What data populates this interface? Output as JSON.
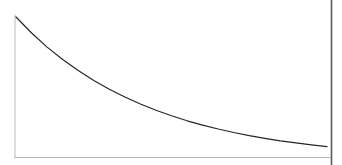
{
  "figure": {
    "title": "",
    "background_color": "#ffffff",
    "width": 342,
    "height": 165,
    "caption": ""
  },
  "axes": {
    "axis_color": "#b9b9b9",
    "axis_width": 1,
    "y_axis": {
      "x": 15,
      "y_top": 15,
      "y_bottom": 157.5
    },
    "x_axis": {
      "y": 157.5,
      "x_left": 15,
      "x_right": 330
    },
    "ticks": [],
    "tick_labels": [],
    "xlabel": "",
    "ylabel": ""
  },
  "page_border": {
    "name": "right-page-edge",
    "color": "#5a5a5a",
    "x": 331.5,
    "y_top": 0,
    "y_bottom": 165,
    "width": 1.6
  },
  "chart_data": {
    "type": "line",
    "title": "",
    "subtitle": "",
    "xlabel": "",
    "ylabel": "",
    "grid": false,
    "legend": [],
    "legend_position": "none",
    "annotations": [],
    "xlim": [
      0,
      1
    ],
    "ylim": [
      0,
      1
    ],
    "axis_ticks_shown": false,
    "series": [
      {
        "name": "exponential-decay",
        "color": "#262626",
        "line_width": 1.2,
        "style": "solid",
        "description": "Smooth monotonically decreasing convex curve (exponential decay) from upper-left to lower-right, asymptotically approaching the horizontal axis.",
        "x": [
          0.0,
          0.05,
          0.1,
          0.15,
          0.2,
          0.25,
          0.3,
          0.35,
          0.4,
          0.45,
          0.5,
          0.55,
          0.6,
          0.65,
          0.7,
          0.75,
          0.8,
          0.85,
          0.9,
          0.95,
          1.0
        ],
        "y": [
          1.0,
          0.886,
          0.782,
          0.69,
          0.608,
          0.535,
          0.47,
          0.412,
          0.36,
          0.314,
          0.273,
          0.236,
          0.204,
          0.175,
          0.149,
          0.126,
          0.106,
          0.088,
          0.072,
          0.058,
          0.045
        ],
        "pixel_points": [
          [
            16.0,
            17.0
          ],
          [
            31.6,
            33.0
          ],
          [
            47.1,
            47.1
          ],
          [
            62.7,
            59.5
          ],
          [
            78.2,
            70.6
          ],
          [
            93.8,
            80.4
          ],
          [
            109.3,
            89.2
          ],
          [
            124.9,
            97.0
          ],
          [
            140.4,
            104.0
          ],
          [
            156.0,
            110.3
          ],
          [
            171.5,
            115.8
          ],
          [
            187.1,
            120.8
          ],
          [
            202.6,
            125.1
          ],
          [
            218.2,
            129.0
          ],
          [
            233.7,
            132.5
          ],
          [
            249.3,
            135.6
          ],
          [
            264.8,
            138.3
          ],
          [
            280.4,
            140.8
          ],
          [
            295.9,
            142.9
          ],
          [
            311.5,
            144.8
          ],
          [
            327.0,
            146.6
          ]
        ]
      }
    ]
  }
}
